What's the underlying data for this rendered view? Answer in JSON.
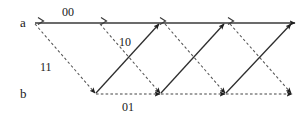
{
  "diagram": {
    "type": "trellis",
    "title": "",
    "states": [
      {
        "id": "a",
        "label": "a",
        "row_y": 23
      },
      {
        "id": "b",
        "label": "b",
        "row_y": 94
      }
    ],
    "stages": [
      35,
      100,
      160,
      225,
      292
    ],
    "edge_labels": {
      "a_to_a": "00",
      "b_to_a": "10",
      "a_to_b": "11",
      "b_to_b": "01"
    },
    "transitions": [
      {
        "name": "a-to-a",
        "from": "a",
        "to": "a",
        "style": "solid",
        "label": "00",
        "marker": "chevron"
      },
      {
        "name": "a-to-b",
        "from": "a",
        "to": "b",
        "style": "dashed",
        "label": "11",
        "marker": "arrow"
      },
      {
        "name": "b-to-a",
        "from": "b",
        "to": "a",
        "style": "solid",
        "label": "10",
        "marker": "arrow"
      },
      {
        "name": "b-to-b",
        "from": "b",
        "to": "b",
        "style": "dashed",
        "label": "01",
        "marker": "arrow"
      }
    ],
    "colors": {
      "line": "#3a3a3a",
      "dash": "#555555",
      "text": "#1a1a1a",
      "background": "#ffffff"
    }
  }
}
